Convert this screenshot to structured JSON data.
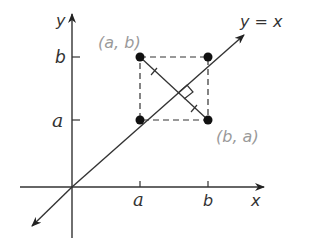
{
  "diagram": {
    "axes": {
      "x_label": "x",
      "y_label": "y",
      "x_ticks": [
        "a",
        "b"
      ],
      "y_ticks": [
        "b",
        "a"
      ]
    },
    "line_label": "y = x",
    "points": [
      {
        "id": "ab",
        "label": "(a, b)"
      },
      {
        "id": "ba",
        "label": "(b, a)"
      },
      {
        "id": "aa",
        "label": ""
      },
      {
        "id": "bb",
        "label": ""
      }
    ],
    "colors": {
      "ink": "#222222",
      "point_label": "#9a9a9a"
    }
  }
}
